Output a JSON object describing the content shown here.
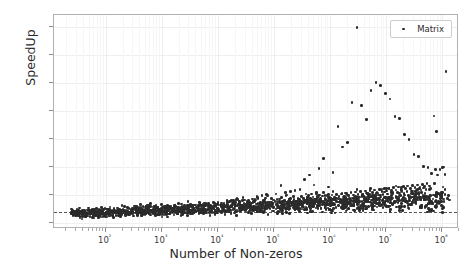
{
  "chart_data": {
    "type": "scatter",
    "title": "",
    "xlabel": "Number of Non-zeros",
    "ylabel": "SpeedUp",
    "xscale": "log",
    "yscale": "linear",
    "xlim": [
      12,
      200000000
    ],
    "ylim": [
      -0.55,
      18.6
    ],
    "grid": true,
    "legend": {
      "position": "upper-right",
      "entries": [
        "Matrix"
      ]
    },
    "xticks": [
      100,
      1000,
      10000,
      100000,
      1000000,
      10000000,
      100000000
    ],
    "xticklabels": [
      "10²",
      "10³",
      "10⁴",
      "10⁵",
      "10⁶",
      "10⁷",
      "10⁸"
    ],
    "yticks": [
      0.0,
      2.5,
      5.0,
      7.5,
      10.0,
      12.5,
      15.0,
      17.5
    ],
    "yticklabels": [
      "0.0",
      "2.5",
      "5.0",
      "7.5",
      "10.0",
      "12.5",
      "15.0",
      "17.5"
    ],
    "reference_line": {
      "y": 1.0,
      "style": "dashed",
      "color": "#555555"
    },
    "marker_color": "#2b2b2b",
    "marker_size": 2.6,
    "series": [
      {
        "name": "Matrix",
        "points": [
          [
            35,
            0.42
          ],
          [
            38,
            0.35
          ],
          [
            44,
            0.55
          ],
          [
            48,
            0.6
          ],
          [
            52,
            1.05
          ],
          [
            55,
            0.95
          ],
          [
            58,
            0.5
          ],
          [
            62,
            0.45
          ],
          [
            66,
            0.62
          ],
          [
            70,
            0.75
          ],
          [
            74,
            0.58
          ],
          [
            78,
            0.88
          ],
          [
            82,
            0.7
          ],
          [
            86,
            1.0
          ],
          [
            90,
            0.92
          ],
          [
            95,
            0.65
          ],
          [
            100,
            0.55
          ],
          [
            105,
            0.78
          ],
          [
            110,
            0.85
          ],
          [
            115,
            0.6
          ],
          [
            120,
            0.95
          ],
          [
            126,
            1.05
          ],
          [
            132,
            0.72
          ],
          [
            138,
            0.5
          ],
          [
            145,
            0.88
          ],
          [
            152,
            0.66
          ],
          [
            160,
            0.9
          ],
          [
            168,
            1.1
          ],
          [
            176,
            0.8
          ],
          [
            185,
            0.58
          ],
          [
            194,
            0.75
          ],
          [
            204,
            1.25
          ],
          [
            214,
            0.95
          ],
          [
            225,
            0.68
          ],
          [
            236,
            0.85
          ],
          [
            248,
            1.0
          ],
          [
            260,
            0.72
          ],
          [
            273,
            0.9
          ],
          [
            287,
            1.15
          ],
          [
            301,
            0.78
          ],
          [
            316,
            0.6
          ],
          [
            332,
            0.88
          ],
          [
            349,
            1.05
          ],
          [
            366,
            0.75
          ],
          [
            384,
            0.95
          ],
          [
            404,
            1.2
          ],
          [
            424,
            0.82
          ],
          [
            445,
            0.65
          ],
          [
            467,
            0.9
          ],
          [
            490,
            1.1
          ],
          [
            515,
            0.78
          ],
          [
            540,
            0.95
          ],
          [
            567,
            1.3
          ],
          [
            595,
            0.85
          ],
          [
            625,
            0.7
          ],
          [
            656,
            1.0
          ],
          [
            689,
            1.15
          ],
          [
            723,
            0.8
          ],
          [
            759,
            0.92
          ],
          [
            797,
            1.05
          ],
          [
            837,
            0.75
          ],
          [
            878,
            0.88
          ],
          [
            922,
            1.2
          ],
          [
            968,
            0.95
          ],
          [
            1016,
            0.7
          ],
          [
            1067,
            1.0
          ],
          [
            1120,
            1.35
          ],
          [
            1176,
            0.85
          ],
          [
            1234,
            0.95
          ],
          [
            1296,
            1.1
          ],
          [
            1360,
            0.78
          ],
          [
            1428,
            0.9
          ],
          [
            1499,
            1.25
          ],
          [
            1574,
            1.0
          ],
          [
            1652,
            0.72
          ],
          [
            1735,
            0.95
          ],
          [
            1821,
            1.15
          ],
          [
            1912,
            0.85
          ],
          [
            2007,
            1.05
          ],
          [
            2107,
            1.3
          ],
          [
            2212,
            0.9
          ],
          [
            2323,
            0.75
          ],
          [
            2439,
            1.0
          ],
          [
            2560,
            1.2
          ],
          [
            2688,
            0.88
          ],
          [
            2822,
            1.05
          ],
          [
            2963,
            1.45
          ],
          [
            3111,
            0.95
          ],
          [
            3266,
            0.8
          ],
          [
            3430,
            1.1
          ],
          [
            3601,
            1.28
          ],
          [
            3781,
            0.92
          ],
          [
            3970,
            1.0
          ],
          [
            4169,
            1.35
          ],
          [
            4377,
            1.05
          ],
          [
            4596,
            0.85
          ],
          [
            4826,
            1.15
          ],
          [
            5067,
            1.3
          ],
          [
            5320,
            0.95
          ],
          [
            5586,
            1.08
          ],
          [
            5866,
            1.5
          ],
          [
            6159,
            1.0
          ],
          [
            6467,
            0.88
          ],
          [
            6790,
            1.2
          ],
          [
            7130,
            1.4
          ],
          [
            7486,
            1.02
          ],
          [
            7861,
            0.95
          ],
          [
            8254,
            1.25
          ],
          [
            8666,
            1.55
          ],
          [
            9100,
            1.1
          ],
          [
            9555,
            0.9
          ],
          [
            10032,
            1.3
          ],
          [
            10534,
            1.6
          ],
          [
            11061,
            1.05
          ],
          [
            11614,
            0.95
          ],
          [
            12194,
            1.35
          ],
          [
            12804,
            1.7
          ],
          [
            13444,
            1.15
          ],
          [
            14117,
            1.0
          ],
          [
            14822,
            1.4
          ],
          [
            15564,
            1.85
          ],
          [
            16342,
            1.2
          ],
          [
            17159,
            1.05
          ],
          [
            18017,
            1.45
          ],
          [
            18918,
            2.0
          ],
          [
            19864,
            1.25
          ],
          [
            20857,
            1.0
          ],
          [
            21900,
            1.5
          ],
          [
            22995,
            2.1
          ],
          [
            24145,
            1.3
          ],
          [
            25352,
            1.08
          ],
          [
            26620,
            1.55
          ],
          [
            27951,
            2.25
          ],
          [
            29348,
            1.35
          ],
          [
            30816,
            1.1
          ],
          [
            32356,
            1.6
          ],
          [
            33974,
            1.95
          ],
          [
            35673,
            1.4
          ],
          [
            37456,
            1.15
          ],
          [
            39329,
            1.65
          ],
          [
            41296,
            2.15
          ],
          [
            43360,
            1.45
          ],
          [
            45528,
            1.2
          ],
          [
            47805,
            1.7
          ],
          [
            50195,
            2.35
          ],
          [
            52705,
            1.5
          ],
          [
            55340,
            1.25
          ],
          [
            58107,
            1.75
          ],
          [
            61012,
            2.45
          ],
          [
            64063,
            1.55
          ],
          [
            67266,
            1.3
          ],
          [
            70629,
            1.8
          ],
          [
            74161,
            2.55
          ],
          [
            77869,
            1.6
          ],
          [
            81762,
            1.35
          ],
          [
            85850,
            1.85
          ],
          [
            90143,
            2.2
          ],
          [
            94650,
            1.65
          ],
          [
            99382,
            1.4
          ],
          [
            104351,
            1.9
          ],
          [
            109569,
            2.6
          ],
          [
            115047,
            1.7
          ],
          [
            120800,
            1.45
          ],
          [
            126840,
            1.95
          ],
          [
            133182,
            3.35
          ],
          [
            139841,
            1.75
          ],
          [
            146833,
            1.5
          ],
          [
            154175,
            2.0
          ],
          [
            161884,
            2.7
          ],
          [
            169978,
            1.8
          ],
          [
            178477,
            1.55
          ],
          [
            187401,
            2.05
          ],
          [
            196771,
            2.8
          ],
          [
            206610,
            1.85
          ],
          [
            216940,
            1.6
          ],
          [
            227787,
            2.1
          ],
          [
            239176,
            2.9
          ],
          [
            251135,
            1.9
          ],
          [
            263692,
            1.65
          ],
          [
            276877,
            2.15
          ],
          [
            290721,
            3.0
          ],
          [
            305257,
            1.95
          ],
          [
            320520,
            1.7
          ],
          [
            336546,
            2.2
          ],
          [
            353373,
            3.9
          ],
          [
            371042,
            2.0
          ],
          [
            389594,
            1.75
          ],
          [
            409074,
            2.25
          ],
          [
            429528,
            4.3
          ],
          [
            451004,
            2.05
          ],
          [
            473554,
            1.8
          ],
          [
            497232,
            2.3
          ],
          [
            522094,
            3.4
          ],
          [
            548199,
            2.1
          ],
          [
            575609,
            1.85
          ],
          [
            604389,
            2.35
          ],
          [
            634608,
            4.85
          ],
          [
            666339,
            2.15
          ],
          [
            699656,
            1.9
          ],
          [
            734639,
            2.4
          ],
          [
            771371,
            5.75
          ],
          [
            809939,
            2.2
          ],
          [
            850436,
            1.95
          ],
          [
            892958,
            2.45
          ],
          [
            937606,
            3.2
          ],
          [
            984486,
            2.25
          ],
          [
            1033710,
            2.0
          ],
          [
            1085396,
            2.5
          ],
          [
            1139666,
            4.5
          ],
          [
            1196649,
            2.3
          ],
          [
            1256481,
            2.05
          ],
          [
            1319305,
            2.55
          ],
          [
            1385271,
            8.6
          ],
          [
            1454534,
            2.35
          ],
          [
            1527261,
            2.1
          ],
          [
            1603624,
            2.6
          ],
          [
            1683805,
            6.8
          ],
          [
            1767996,
            2.4
          ],
          [
            1856395,
            2.15
          ],
          [
            1949215,
            2.65
          ],
          [
            2046676,
            7.2
          ],
          [
            2149010,
            2.45
          ],
          [
            2256460,
            2.2
          ],
          [
            2369283,
            2.7
          ],
          [
            2487747,
            10.75
          ],
          [
            2611135,
            2.5
          ],
          [
            2741691,
            2.25
          ],
          [
            2878776,
            2.75
          ],
          [
            3022715,
            17.5
          ],
          [
            3173851,
            2.55
          ],
          [
            3332543,
            2.3
          ],
          [
            3499170,
            2.8
          ],
          [
            3674129,
            10.5
          ],
          [
            3857835,
            2.6
          ],
          [
            4050727,
            2.35
          ],
          [
            4253263,
            2.85
          ],
          [
            4465926,
            9.25
          ],
          [
            4689223,
            2.65
          ],
          [
            4923684,
            2.4
          ],
          [
            5169868,
            2.9
          ],
          [
            5428361,
            11.85
          ],
          [
            5699779,
            2.7
          ],
          [
            5984768,
            2.45
          ],
          [
            6284007,
            2.95
          ],
          [
            6598207,
            12.55
          ],
          [
            6928117,
            2.75
          ],
          [
            7274523,
            2.5
          ],
          [
            7638249,
            3.0
          ],
          [
            8020162,
            12.3
          ],
          [
            8421170,
            2.8
          ],
          [
            8842228,
            2.55
          ],
          [
            9284340,
            3.05
          ],
          [
            9748557,
            11.55
          ],
          [
            10235985,
            2.85
          ],
          [
            10747784,
            2.6
          ],
          [
            11285173,
            3.1
          ],
          [
            11849432,
            11.1
          ],
          [
            12441904,
            2.9
          ],
          [
            13063999,
            2.65
          ],
          [
            13717199,
            3.15
          ],
          [
            14403059,
            9.5
          ],
          [
            15123212,
            2.95
          ],
          [
            15879373,
            2.7
          ],
          [
            16673342,
            3.2
          ],
          [
            17507009,
            9.35
          ],
          [
            18382359,
            3.0
          ],
          [
            19301477,
            2.75
          ],
          [
            20266551,
            3.25
          ],
          [
            21279879,
            7.9
          ],
          [
            22343873,
            3.05
          ],
          [
            23461067,
            2.8
          ],
          [
            24634120,
            3.3
          ],
          [
            25865826,
            7.45
          ],
          [
            27159117,
            3.1
          ],
          [
            28517073,
            2.85
          ],
          [
            29942927,
            3.35
          ],
          [
            31440073,
            6.1
          ],
          [
            33012077,
            3.15
          ],
          [
            34662681,
            2.9
          ],
          [
            36395815,
            3.4
          ],
          [
            38215606,
            5.95
          ],
          [
            40126386,
            3.2
          ],
          [
            42132705,
            2.95
          ],
          [
            44239341,
            3.45
          ],
          [
            46451308,
            5.05
          ],
          [
            48773873,
            3.25
          ],
          [
            51212567,
            3.0
          ],
          [
            53773195,
            3.5
          ],
          [
            56461855,
            4.95
          ],
          [
            59284948,
            3.3
          ],
          [
            62249195,
            3.05
          ],
          [
            65361655,
            4.4
          ],
          [
            68629738,
            2.15
          ],
          [
            72061225,
            9.55
          ],
          [
            75664286,
            4.8
          ],
          [
            79447500,
            8.2
          ],
          [
            83419875,
            4.3
          ],
          [
            87590869,
            2.6
          ],
          [
            91970412,
            4.75
          ],
          [
            96568933,
            2.3
          ],
          [
            101397380,
            4.95
          ],
          [
            106467249,
            5.0
          ],
          [
            111790611,
            4.35
          ],
          [
            117380142,
            13.55
          ],
          [
            123249149,
            2.2
          ],
          [
            129411606,
            2.45
          ],
          [
            135882186,
            2.05
          ]
        ]
      }
    ]
  },
  "legend": {
    "label": "Matrix"
  },
  "axes": {
    "xlabel": "Number of Non-zeros",
    "ylabel": "SpeedUp"
  }
}
